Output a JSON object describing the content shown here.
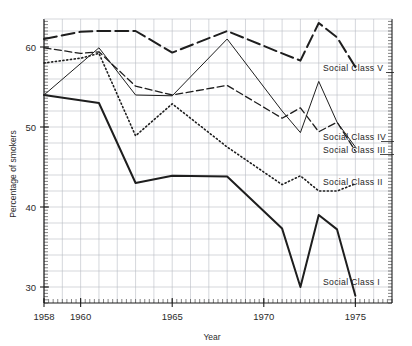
{
  "chart_data": {
    "type": "line",
    "title": "",
    "xlabel": "Year",
    "ylabel": "Percentage of smokers",
    "xlim": [
      1958,
      1977
    ],
    "ylim": [
      28,
      63.5
    ],
    "xticks": [
      1958,
      1960,
      1965,
      1970,
      1975
    ],
    "xtick_labels": [
      "1958",
      "1960",
      "1965",
      "1970",
      "1975"
    ],
    "yticks": [
      30,
      40,
      50,
      60
    ],
    "ytick_labels": [
      "30",
      "40",
      "50",
      "60"
    ],
    "grid": true,
    "legend_position": "inline-right",
    "series": [
      {
        "name": "Social Class V",
        "label": "Social  Class  V",
        "style": "long-dash",
        "x": [
          1958,
          1960,
          1961,
          1963,
          1965,
          1968,
          1971,
          1972,
          1973,
          1974,
          1975
        ],
        "values": [
          61.0,
          61.9,
          62.0,
          62.0,
          59.3,
          62.0,
          59.2,
          58.3,
          63.0,
          61.2,
          57.5
        ]
      },
      {
        "name": "Social Class IV",
        "label": "Social  Class  IV",
        "style": "thin-solid",
        "x": [
          1958,
          1961,
          1963,
          1965,
          1968,
          1971,
          1972,
          1973,
          1974,
          1975
        ],
        "values": [
          54.0,
          59.9,
          54.0,
          53.9,
          61.0,
          52.0,
          49.3,
          55.7,
          50.6,
          47.5
        ]
      },
      {
        "name": "Social Class III",
        "label": "Social  Class  III",
        "style": "medium-dash",
        "x": [
          1958,
          1960,
          1961,
          1963,
          1965,
          1968,
          1971,
          1972,
          1973,
          1974,
          1975
        ],
        "values": [
          59.9,
          59.2,
          59.4,
          55.1,
          54.0,
          55.2,
          51.1,
          52.4,
          49.4,
          50.6,
          47.0
        ]
      },
      {
        "name": "Social Class II",
        "label": "Social  Class  II",
        "style": "dotted",
        "x": [
          1958,
          1960,
          1961,
          1963,
          1965,
          1968,
          1971,
          1972,
          1973,
          1974,
          1975
        ],
        "values": [
          58.0,
          58.6,
          59.2,
          48.9,
          52.9,
          47.5,
          42.8,
          43.9,
          42.0,
          42.0,
          42.9
        ]
      },
      {
        "name": "Social Class I",
        "label": "Social  Class  I",
        "style": "thick-solid",
        "x": [
          1958,
          1961,
          1963,
          1965,
          1968,
          1971,
          1972,
          1973,
          1974,
          1975
        ],
        "values": [
          54.0,
          53.0,
          43.0,
          43.9,
          43.8,
          37.3,
          30.0,
          39.0,
          37.2,
          28.9
        ]
      }
    ]
  },
  "axes": {
    "x_axis_title": "Year",
    "y_axis_title": "Percentage of smokers"
  },
  "colors": {
    "ink": "#1e1e1e",
    "grid": "#b9bcc4",
    "background": "#ffffff"
  }
}
